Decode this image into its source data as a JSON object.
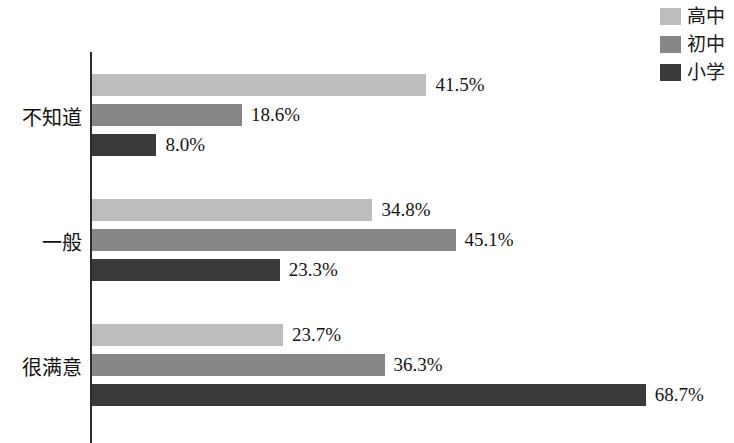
{
  "chart_data": {
    "type": "bar",
    "orientation": "horizontal",
    "title": "",
    "xlabel": "",
    "ylabel": "",
    "grid": false,
    "legend_position": "top-right",
    "axis_max": 75,
    "categories": [
      "不知道",
      "一般",
      "很满意"
    ],
    "series": [
      {
        "name": "高中",
        "color": "#bdbdbd",
        "values": [
          41.5,
          34.8,
          23.7
        ],
        "labels": [
          "41.5%",
          "34.8%",
          "23.7%"
        ]
      },
      {
        "name": "初中",
        "color": "#878787",
        "values": [
          18.6,
          45.1,
          36.3
        ],
        "labels": [
          "18.6%",
          "45.1%",
          "36.3%"
        ]
      },
      {
        "name": "小学",
        "color": "#3a3a3a",
        "values": [
          8.0,
          23.3,
          68.7
        ],
        "labels": [
          "8.0%",
          "23.3%",
          "68.7%"
        ]
      }
    ]
  },
  "legend": {
    "items": [
      {
        "label": "高中",
        "color": "#bdbdbd"
      },
      {
        "label": "初中",
        "color": "#878787"
      },
      {
        "label": "小学",
        "color": "#3a3a3a"
      }
    ]
  },
  "axis": {
    "categories": [
      "不知道",
      "一般",
      "很满意"
    ]
  }
}
